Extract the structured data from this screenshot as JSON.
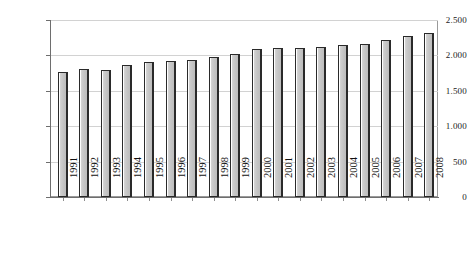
{
  "chart_data": {
    "type": "bar",
    "title": "",
    "subtitle": "",
    "xlabel": "",
    "ylabel": "",
    "categories": [
      "1991",
      "1992",
      "1993",
      "1994",
      "1995",
      "1996",
      "1997",
      "1998",
      "1999",
      "2000",
      "2001",
      "2002",
      "2003",
      "2004",
      "2005",
      "2006",
      "2007",
      "2008"
    ],
    "values": [
      1770,
      1810,
      1800,
      1860,
      1900,
      1925,
      1940,
      1975,
      2025,
      2085,
      2100,
      2110,
      2115,
      2140,
      2160,
      2215,
      2275,
      2310
    ],
    "series": [
      {
        "name": "",
        "values": [
          1770,
          1810,
          1800,
          1860,
          1900,
          1925,
          1940,
          1975,
          2025,
          2085,
          2100,
          2110,
          2115,
          2140,
          2160,
          2215,
          2275,
          2310
        ]
      }
    ],
    "ylim": [
      0,
      2500
    ],
    "ytick_values": [
      0,
      500,
      1000,
      1500,
      2000,
      2500
    ],
    "ytick_labels": [
      "0",
      "500",
      "1.000",
      "1.500",
      "2.000",
      "2.500"
    ],
    "grid": true,
    "grid_axis": "y",
    "legend": false,
    "legend_position": "none",
    "annotations": [],
    "colors": {
      "bar_fill": "#c4c4c4",
      "bar_highlight": "#ffffff",
      "bar_outline": "#2a2a2a",
      "gridline": "#d2d2d2",
      "axis": "#6e6e6e",
      "frame": "#9a9a9a",
      "text": "#111111",
      "background": "#ffffff"
    }
  }
}
